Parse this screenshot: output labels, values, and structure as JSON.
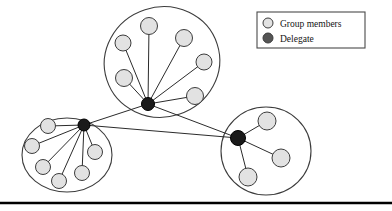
{
  "figure": {
    "title": "",
    "background": "#ffffff",
    "width": 392,
    "height": 211
  },
  "colors": {
    "member_fill": "#e2e2e2",
    "member_stroke": "#3c3c3c",
    "delegate_fill": "#1a1a1a",
    "delegate_stroke": "#000000",
    "group_outline": "#3c3c3c",
    "edge": "#2b2b2b",
    "legend_border": "#4a4a4a",
    "legend_text": "#141414",
    "rule": "#000000"
  },
  "legend": {
    "box": {
      "x": 257,
      "y": 12,
      "width": 108,
      "height": 36
    },
    "items": [
      {
        "label": "Group members",
        "marker": "member-circle-icon",
        "fill": "#e2e2e2"
      },
      {
        "label": "Delegate",
        "marker": "delegate-circle-icon",
        "fill": "#555555"
      }
    ]
  },
  "groups": [
    {
      "id": "group-top",
      "name": "top-group",
      "shape": "ellipse",
      "cx": 162,
      "cy": 62,
      "rx": 58,
      "ry": 55,
      "rotate": -18,
      "delegate": {
        "id": "delegate-top",
        "x": 148,
        "y": 104,
        "r": 6.5
      },
      "members": [
        {
          "id": "top-m1",
          "x": 123,
          "y": 43,
          "r": 8
        },
        {
          "id": "top-m2",
          "x": 149,
          "y": 26,
          "r": 8.5
        },
        {
          "id": "top-m3",
          "x": 184,
          "y": 38,
          "r": 8.5
        },
        {
          "id": "top-m4",
          "x": 204,
          "y": 62,
          "r": 8
        },
        {
          "id": "top-m5",
          "x": 124,
          "y": 78,
          "r": 8.5
        },
        {
          "id": "top-m6",
          "x": 195,
          "y": 96,
          "r": 8.5
        }
      ]
    },
    {
      "id": "group-left",
      "name": "left-group",
      "shape": "ellipse",
      "cx": 67,
      "cy": 155,
      "rx": 45,
      "ry": 37,
      "rotate": 0,
      "delegate": {
        "id": "delegate-left",
        "x": 84,
        "y": 125,
        "r": 6
      },
      "members": [
        {
          "id": "left-m1",
          "x": 48,
          "y": 126,
          "r": 7.5
        },
        {
          "id": "left-m2",
          "x": 32,
          "y": 146,
          "r": 7.5
        },
        {
          "id": "left-m3",
          "x": 43,
          "y": 167,
          "r": 7.5
        },
        {
          "id": "left-m4",
          "x": 59,
          "y": 181,
          "r": 7.5
        },
        {
          "id": "left-m5",
          "x": 82,
          "y": 173,
          "r": 7.5
        },
        {
          "id": "left-m6",
          "x": 95,
          "y": 152,
          "r": 7.5
        }
      ]
    },
    {
      "id": "group-right",
      "name": "right-group",
      "shape": "ellipse",
      "cx": 266,
      "cy": 151,
      "rx": 45,
      "ry": 44,
      "rotate": 0,
      "delegate": {
        "id": "delegate-right",
        "x": 238,
        "y": 138,
        "r": 7.5
      },
      "members": [
        {
          "id": "right-m1",
          "x": 267,
          "y": 121,
          "r": 9
        },
        {
          "id": "right-m2",
          "x": 281,
          "y": 158,
          "r": 9
        },
        {
          "id": "right-m3",
          "x": 248,
          "y": 177,
          "r": 9
        }
      ]
    }
  ],
  "inter_group_links": [
    {
      "from": "delegate-top",
      "to": "delegate-left"
    },
    {
      "from": "delegate-top",
      "to": "delegate-right"
    },
    {
      "from": "delegate-left",
      "to": "delegate-right"
    }
  ],
  "bottom_rule": {
    "y": 203,
    "thickness": 2.5
  }
}
